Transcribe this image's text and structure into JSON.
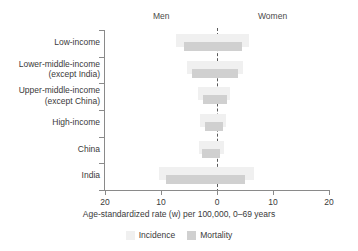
{
  "header": {
    "men_label": "Men",
    "women_label": "Women"
  },
  "axis": {
    "title": "Age-standardized rate (w) per 100,000, 0–69 years",
    "tick_labels": [
      "20",
      "10",
      "0",
      "10",
      "20"
    ]
  },
  "legend": {
    "items": [
      {
        "label": "Incidence",
        "color": "#f0f0f0"
      },
      {
        "label": "Mortality",
        "color": "#d0d0d0"
      }
    ]
  },
  "chart_data": {
    "type": "bar",
    "orientation": "horizontal",
    "style": "back-to-back bidirectional (men left of zero, women right of zero)",
    "title": "",
    "xlabel": "Age-standardized rate (w) per 100,000, 0–69 years",
    "ylabel": "",
    "xlim": [
      -20,
      20
    ],
    "xticks": [
      -20,
      -10,
      0,
      10,
      20
    ],
    "xtick_labels": [
      "20",
      "10",
      "0",
      "10",
      "20"
    ],
    "grid": false,
    "zero_line": true,
    "zero_line_style": "dashed",
    "legend_position": "bottom-center",
    "left_side_label": "Men",
    "right_side_label": "Women",
    "categories": [
      "Low-income",
      "Lower-middle-income (except India)",
      "Upper-middle-income (except China)",
      "High-income",
      "China",
      "India"
    ],
    "category_labels_multiline": [
      [
        "Low-income"
      ],
      [
        "Lower-middle-income",
        "(except India)"
      ],
      [
        "Upper-middle-income",
        "(except China)"
      ],
      [
        "High-income"
      ],
      [
        "China"
      ],
      [
        "India"
      ]
    ],
    "series": [
      {
        "name": "Incidence",
        "color": "#f0f0f0",
        "men": [
          7.4,
          5.4,
          3.4,
          3.0,
          3.2,
          10.4
        ],
        "women": [
          5.8,
          4.6,
          2.4,
          1.6,
          1.2,
          6.6
        ]
      },
      {
        "name": "Mortality",
        "color": "#d0d0d0",
        "men": [
          5.9,
          4.5,
          2.5,
          2.1,
          2.7,
          9.1
        ],
        "women": [
          4.5,
          3.8,
          1.8,
          1.1,
          0.5,
          5.0
        ]
      }
    ]
  }
}
